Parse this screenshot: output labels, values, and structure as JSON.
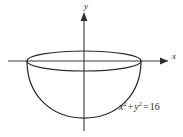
{
  "figure": {
    "caption_equation": {
      "full_text": "x² + y² = 16",
      "lhs_var1": "x",
      "lhs_exp1": "2",
      "plus": "+",
      "lhs_var2": "y",
      "lhs_exp2": "2",
      "equals": "=",
      "rhs_value": "16"
    },
    "axes": {
      "y_label": "y",
      "x_label": "x",
      "origin_x": 84,
      "origin_y": 61
    },
    "solid": {
      "name": "hemisphere-bowl",
      "radius_value": 4,
      "rim_center_x": 84,
      "rim_center_y": 61,
      "rim_semi_major": 57,
      "rim_semi_minor": 10,
      "bowl_bottom_y": 118
    },
    "colors": {
      "stroke": "#2b2b2b",
      "axis": "#3a3a3a",
      "background": "#ffffff"
    }
  }
}
